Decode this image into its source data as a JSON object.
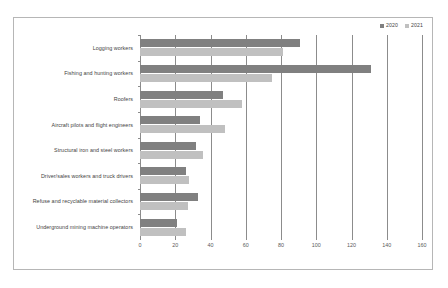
{
  "chart_data": {
    "type": "bar",
    "orientation": "horizontal",
    "title": "",
    "subtitle": "",
    "xlabel": "",
    "ylabel": "",
    "xlim": [
      0,
      160
    ],
    "xticks": [
      0,
      20,
      40,
      60,
      80,
      100,
      120,
      140,
      160
    ],
    "xtick_labels": [
      "0",
      "20",
      "40",
      "60",
      "80",
      "100",
      "120",
      "140",
      "160"
    ],
    "grid": true,
    "grid_axis": "x",
    "legend_position": "top-right",
    "categories": [
      "Logging workers",
      "Fishing and hunting workers",
      "Roofers",
      "Aircraft pilots and flight engineers",
      "Structural iron and steel workers",
      "Driver/sales workers and truck drivers",
      "Refuse and recyclable material collectors",
      "Underground mining machine operators"
    ],
    "series": [
      {
        "name": "2020",
        "color": "#808080",
        "values": [
          91,
          131,
          47,
          34,
          32,
          26,
          33,
          21
        ]
      },
      {
        "name": "2021",
        "color": "#c0c0c0",
        "values": [
          81,
          75,
          58,
          48,
          36,
          28,
          27,
          26
        ]
      }
    ]
  },
  "colors": {
    "series_2020": "#808080",
    "series_2021": "#c0c0c0",
    "gridline": "#8c8c8c",
    "frame_border": "#b6b6b6",
    "label_text": "#3f3f3f",
    "tick_text": "#5a5a5a",
    "background": "#ffffff"
  }
}
